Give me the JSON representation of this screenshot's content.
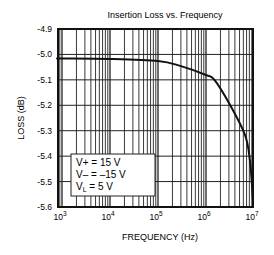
{
  "chart_data": {
    "type": "line",
    "title": "Insertion Loss vs. Frequency",
    "xlabel": "FREQUENCY (Hz)",
    "ylabel": "LOSS  (dB)",
    "xscale": "log",
    "xlim": [
      825,
      10000000
    ],
    "ylim": [
      -5.6,
      -4.9
    ],
    "grid": true,
    "x_ticks": [
      1000,
      10000,
      100000,
      1000000,
      10000000
    ],
    "x_tick_labels": [
      {
        "base": "10",
        "exp": "3"
      },
      {
        "base": "10",
        "exp": "4"
      },
      {
        "base": "10",
        "exp": "5"
      },
      {
        "base": "10",
        "exp": "6"
      },
      {
        "base": "10",
        "exp": "7"
      }
    ],
    "y_ticks": [
      -4.9,
      -5.0,
      -5.1,
      -5.2,
      -5.3,
      -5.4,
      -5.5,
      -5.6
    ],
    "y_tick_labels": [
      "-4.9",
      "-5.0",
      "-5.1",
      "-5.2",
      "-5.3",
      "-5.4",
      "-5.5",
      "-5.6"
    ],
    "series": [
      {
        "name": "Insertion Loss",
        "x": [
          825,
          1000,
          10000,
          100000,
          290000,
          1000000,
          1500000,
          3200000,
          6500000,
          8200000,
          9500000
        ],
        "y": [
          -5.016,
          -5.016,
          -5.018,
          -5.026,
          -5.045,
          -5.081,
          -5.1,
          -5.2,
          -5.317,
          -5.415,
          -5.57
        ]
      }
    ],
    "annotations": {
      "legend_box": [
        {
          "label": "V+",
          "sub": "",
          "value": "=  15 V"
        },
        {
          "label": "V–",
          "sub": "",
          "value": "=  –15 V"
        },
        {
          "label": "V",
          "sub": "L",
          "value": "= 5 V"
        }
      ],
      "legend_position": "lower-left"
    },
    "colors": {
      "line": "#111111",
      "grid": "#222222",
      "background": "#ffffff"
    }
  }
}
